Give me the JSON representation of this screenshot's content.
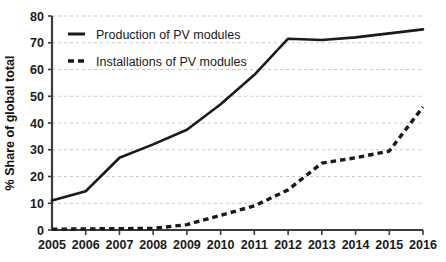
{
  "chart_data": {
    "type": "line",
    "title": "",
    "xlabel": "",
    "ylabel": "% Share of global total",
    "x": [
      2005,
      2006,
      2007,
      2008,
      2009,
      2010,
      2011,
      2012,
      2013,
      2014,
      2015,
      2016
    ],
    "xtick_labels": [
      "2005",
      "2006",
      "2007",
      "2008",
      "2009",
      "2010",
      "2011",
      "2012",
      "2013",
      "2014",
      "2015",
      "2016"
    ],
    "ytick_labels": [
      "0",
      "10",
      "20",
      "30",
      "40",
      "50",
      "60",
      "70",
      "80"
    ],
    "yticks": [
      0,
      10,
      20,
      30,
      40,
      50,
      60,
      70,
      80
    ],
    "ylim": [
      0,
      80
    ],
    "xlim": [
      2005,
      2016
    ],
    "grid": "horizontal-dashed",
    "legend_position": "top-left-inside",
    "series": [
      {
        "name": "Production of PV modules",
        "style": "solid",
        "color": "#1a1a1a",
        "values": [
          11,
          14.5,
          27,
          32,
          37.5,
          47,
          58,
          71.5,
          71,
          72,
          73.5,
          75
        ]
      },
      {
        "name": "Installations of PV modules",
        "style": "dashed",
        "color": "#1a1a1a",
        "values": [
          0.3,
          0.4,
          0.5,
          0.6,
          2,
          5.5,
          9,
          15,
          25,
          27,
          29.5,
          46
        ]
      }
    ]
  },
  "legend": {
    "items": [
      {
        "label": "Production of PV modules",
        "style": "solid"
      },
      {
        "label": "Installations of PV modules",
        "style": "dashed"
      }
    ]
  },
  "axes": {
    "y_title": "% Share of global total"
  },
  "colors": {
    "line": "#1a1a1a",
    "axis": "#3c3c3c",
    "gridline": "#c9c9c9",
    "background": "#ffffff"
  }
}
